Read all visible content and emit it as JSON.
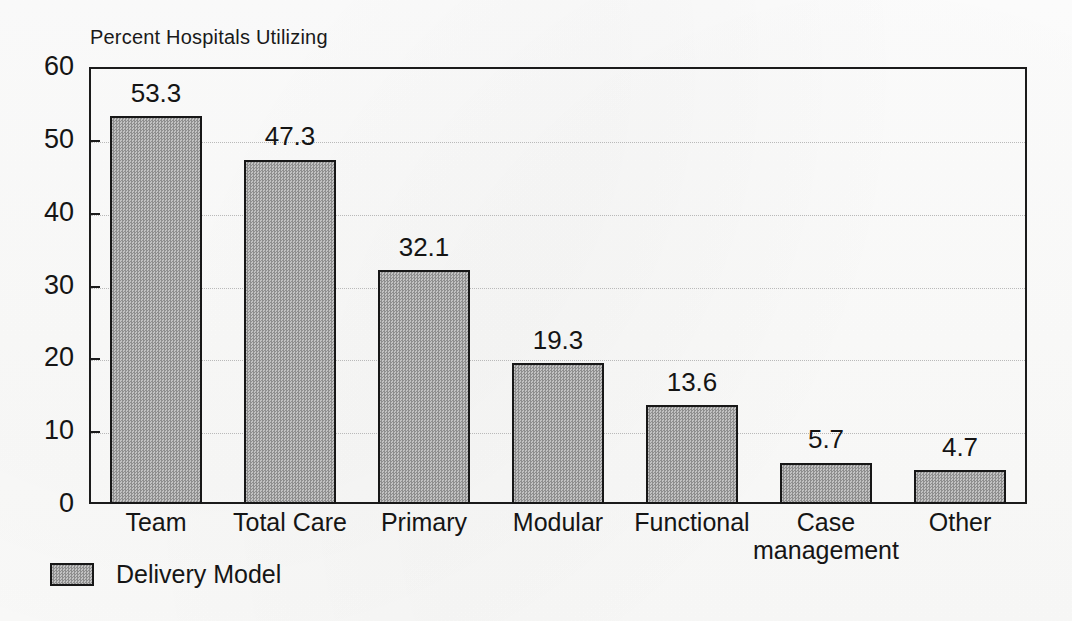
{
  "chart_data": {
    "type": "bar",
    "title": "Percent Hospitals Utilizing",
    "xlabel": "",
    "ylabel": "",
    "categories": [
      "Team",
      "Total Care",
      "Primary",
      "Modular",
      "Functional",
      "Case management",
      "Other"
    ],
    "category_lines": [
      [
        "Team"
      ],
      [
        "Total Care"
      ],
      [
        "Primary"
      ],
      [
        "Modular"
      ],
      [
        "Functional"
      ],
      [
        "Case",
        "management"
      ],
      [
        "Other"
      ]
    ],
    "values": [
      53.3,
      47.3,
      32.1,
      19.3,
      13.6,
      5.7,
      4.7
    ],
    "value_labels": [
      "53.3",
      "47.3",
      "32.1",
      "19.3",
      "13.6",
      "5.7",
      "4.7"
    ],
    "ylim": [
      0,
      60
    ],
    "yticks": [
      0,
      10,
      20,
      30,
      40,
      50,
      60
    ],
    "ytick_labels": [
      "0",
      "10",
      "20",
      "30",
      "40",
      "50",
      "60"
    ],
    "grid": true,
    "grid_axis": "y",
    "legend": {
      "position": "below-left",
      "entries": [
        {
          "label": "Delivery Model",
          "color": "#9d9d9d",
          "pattern": "dither-checker"
        }
      ]
    },
    "colors": {
      "bar_fill": "#9d9d9d",
      "bar_edge": "#171717",
      "axis": "#1b1b1b",
      "grid": "#b9b9b9",
      "text": "#151515",
      "background": "#fdfdfc"
    }
  },
  "legend": {
    "entry_label": "Delivery Model"
  }
}
